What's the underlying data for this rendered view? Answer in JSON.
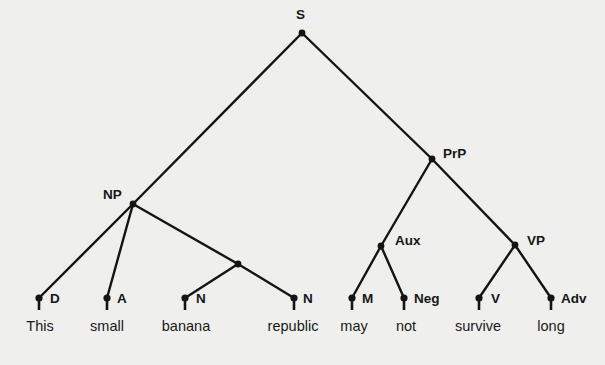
{
  "diagram": {
    "type": "syntax-tree",
    "root": "S",
    "nodes": [
      {
        "id": "S",
        "label": "S",
        "x": 302,
        "y": 33
      },
      {
        "id": "NP",
        "label": "NP",
        "x": 133,
        "y": 204
      },
      {
        "id": "Nbar",
        "label": "",
        "x": 238,
        "y": 264
      },
      {
        "id": "PrP",
        "label": "PrP",
        "x": 432,
        "y": 159
      },
      {
        "id": "Aux",
        "label": "Aux",
        "x": 381,
        "y": 246
      },
      {
        "id": "VP",
        "label": "VP",
        "x": 515,
        "y": 245
      },
      {
        "id": "D",
        "label": "D",
        "x": 39,
        "y": 298,
        "word": "This"
      },
      {
        "id": "A",
        "label": "A",
        "x": 107,
        "y": 298,
        "word": "small"
      },
      {
        "id": "N1",
        "label": "N",
        "x": 185,
        "y": 298,
        "word": "banana"
      },
      {
        "id": "N2",
        "label": "N",
        "x": 294,
        "y": 298,
        "word": "republic"
      },
      {
        "id": "M",
        "label": "M",
        "x": 352,
        "y": 298,
        "word": "may"
      },
      {
        "id": "Neg",
        "label": "Neg",
        "x": 404,
        "y": 298,
        "word": "not"
      },
      {
        "id": "V",
        "label": "V",
        "x": 479,
        "y": 298,
        "word": "survive"
      },
      {
        "id": "Adv",
        "label": "Adv",
        "x": 551,
        "y": 298,
        "word": "long"
      }
    ],
    "edges": [
      [
        "S",
        "NP"
      ],
      [
        "S",
        "PrP"
      ],
      [
        "NP",
        "D"
      ],
      [
        "NP",
        "A"
      ],
      [
        "NP",
        "Nbar"
      ],
      [
        "Nbar",
        "N1"
      ],
      [
        "Nbar",
        "N2"
      ],
      [
        "PrP",
        "Aux"
      ],
      [
        "PrP",
        "VP"
      ],
      [
        "Aux",
        "M"
      ],
      [
        "Aux",
        "Neg"
      ],
      [
        "VP",
        "V"
      ],
      [
        "VP",
        "Adv"
      ]
    ],
    "sentence": [
      "This",
      "small",
      "banana",
      "republic",
      "may",
      "not",
      "survive",
      "long"
    ]
  },
  "labels": {
    "S": "S",
    "NP": "NP",
    "PrP": "PrP",
    "Aux": "Aux",
    "VP": "VP",
    "D": "D",
    "A": "A",
    "N1": "N",
    "N2": "N",
    "M": "M",
    "Neg": "Neg",
    "V": "V",
    "Adv": "Adv"
  },
  "words": {
    "w0": "This",
    "w1": "small",
    "w2": "banana",
    "w3": "republic",
    "w4": "may",
    "w5": "not",
    "w6": "survive",
    "w7": "long"
  },
  "colors": {
    "ink": "#141414",
    "paper": "#efefed"
  }
}
